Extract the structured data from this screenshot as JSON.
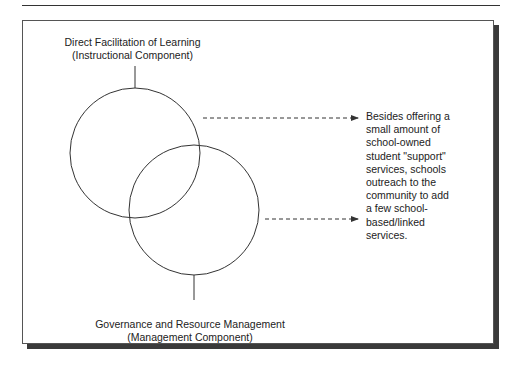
{
  "diagram": {
    "top_component": {
      "title": "Direct Facilitation of Learning",
      "subtitle": "(Instructional Component)"
    },
    "bottom_component": {
      "title": "Governance and Resource Management",
      "subtitle": "(Management Component)"
    },
    "note": {
      "lines": [
        "Besides offering a",
        "small amount of",
        "school-owned",
        "student \"support\"",
        "services, schools",
        "outreach to the",
        "community to add",
        "a few school-",
        "based/linked",
        "services."
      ]
    },
    "colors": {
      "stroke": "#333333",
      "shadow": "#3a3a3a",
      "background": "#ffffff"
    }
  }
}
